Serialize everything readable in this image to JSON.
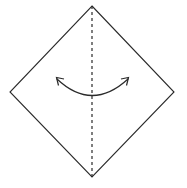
{
  "figure": {
    "type": "origami-fold-instruction",
    "canvas": {
      "width": 187,
      "height": 188,
      "background": "#ffffff"
    },
    "shape": {
      "name": "square-rotated-45",
      "label": "diamond",
      "stroke_color": "#2a2a2a",
      "stroke_width": 1.1,
      "fill_color": "#ffffff",
      "vertices": {
        "top": {
          "x": 92,
          "y": 6
        },
        "right": {
          "x": 174,
          "y": 92
        },
        "bottom": {
          "x": 92,
          "y": 177
        },
        "left": {
          "x": 10,
          "y": 92
        }
      },
      "points_path": "92,6 174,92 92,177 10,92"
    },
    "fold_line": {
      "name": "vertical-center-fold",
      "style": "dashed",
      "meaning": "valley-fold-axis",
      "stroke_color": "#2a2a2a",
      "stroke_width": 1.2,
      "dash_pattern": "3,3",
      "x": 92,
      "y_start": 6,
      "y_end": 177
    },
    "arrow": {
      "name": "double-headed-curved-arrow",
      "meaning": "fold-left-and-right-halves-together",
      "style": "curved-concave-up",
      "stroke_color": "#2a2a2a",
      "stroke_width": 1.2,
      "arc_path": "M 57 79 Q 92 112 128 79",
      "left_head": {
        "direction": "up-left",
        "tip": {
          "x": 57,
          "y": 78
        },
        "path": "M 64 79 L 56.5 77.5 L 58.5 85.5"
      },
      "right_head": {
        "direction": "up-right",
        "tip": {
          "x": 128,
          "y": 78
        },
        "path": "M 121 79 L 128.5 77.5 L 126.5 85.5"
      }
    }
  }
}
